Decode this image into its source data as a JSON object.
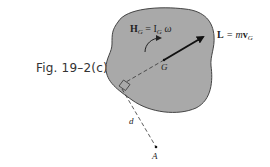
{
  "figure": {
    "caption": "Fig. 19–2(c)",
    "body_fill": "#a9a9a9",
    "body_stroke": "#444444"
  },
  "labels": {
    "angular_momentum_H": "H",
    "angular_momentum_sub": "G",
    "angular_momentum_eq": " = I",
    "inertia_sub": "G",
    "omega": " ω",
    "linear_momentum_L": "L",
    "linear_momentum_eq": " = m",
    "velocity_v": "v",
    "velocity_sub": "G",
    "center_of_mass": "G",
    "distance": "d",
    "point": "A"
  }
}
